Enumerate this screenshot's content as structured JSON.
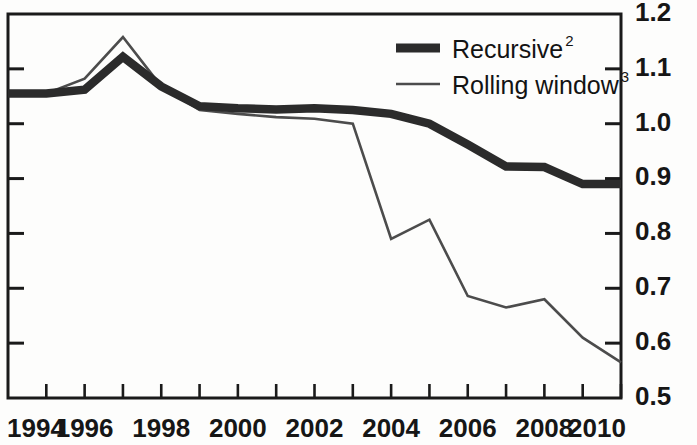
{
  "chart_data": {
    "type": "line",
    "title": "",
    "subtitle": "",
    "xlabel": "",
    "ylabel": "",
    "x": [
      1994,
      1995,
      1996,
      1997,
      1998,
      1999,
      2000,
      2001,
      2002,
      2003,
      2004,
      2005,
      2006,
      2007,
      2008,
      2009,
      2010
    ],
    "xlim": [
      1994,
      2010
    ],
    "ylim": [
      0.5,
      1.2
    ],
    "y_axis_position": "right",
    "y_ticks": [
      0.5,
      0.6,
      0.7,
      0.8,
      0.9,
      1.0,
      1.1,
      1.2
    ],
    "y_tick_labels": [
      "0.5",
      "0.6",
      "0.7",
      "0.8",
      "0.9",
      "1.0",
      "1.1",
      "1.2"
    ],
    "x_ticks": [
      1994,
      1995,
      1996,
      1997,
      1998,
      1999,
      2000,
      2001,
      2002,
      2003,
      2004,
      2005,
      2006,
      2007,
      2008,
      2009,
      2010
    ],
    "x_tick_labels": [
      "1994",
      "",
      "1996",
      "",
      "1998",
      "",
      "2000",
      "",
      "2002",
      "",
      "2004",
      "",
      "2006",
      "",
      "2008",
      "",
      "2010"
    ],
    "x_labels_shown": [
      "1994",
      "1996",
      "1998",
      "2000",
      "2002",
      "2004",
      "2006",
      "2008",
      "2010"
    ],
    "grid": false,
    "legend_position": "top-right",
    "series": [
      {
        "name": "Recursive",
        "footnote_marker": "2",
        "color": "#2b2b2b",
        "line_width": "thick",
        "values": [
          1.055,
          1.055,
          1.062,
          1.122,
          1.068,
          1.032,
          1.028,
          1.026,
          1.028,
          1.025,
          1.018,
          1.0,
          0.962,
          0.922,
          0.921,
          0.89,
          0.89
        ]
      },
      {
        "name": "Rolling window",
        "footnote_marker": "3",
        "color": "#4c4c4c",
        "line_width": "thin",
        "values": [
          1.055,
          1.055,
          1.082,
          1.158,
          1.068,
          1.025,
          1.018,
          1.012,
          1.009,
          1.0,
          0.79,
          0.825,
          0.686,
          0.665,
          0.68,
          0.61,
          0.565
        ]
      }
    ]
  },
  "legend": {
    "entries": [
      {
        "label": "Recursive",
        "sup": "2"
      },
      {
        "label": "Rolling window",
        "sup": "3"
      }
    ]
  },
  "axes": {
    "y_labels": [
      "1.2",
      "1.1",
      "1.0",
      "0.9",
      "0.8",
      "0.7",
      "0.6",
      "0.5"
    ],
    "x_labels": [
      "1994",
      "1996",
      "1998",
      "2000",
      "2002",
      "2004",
      "2006",
      "2008",
      "2010"
    ]
  }
}
